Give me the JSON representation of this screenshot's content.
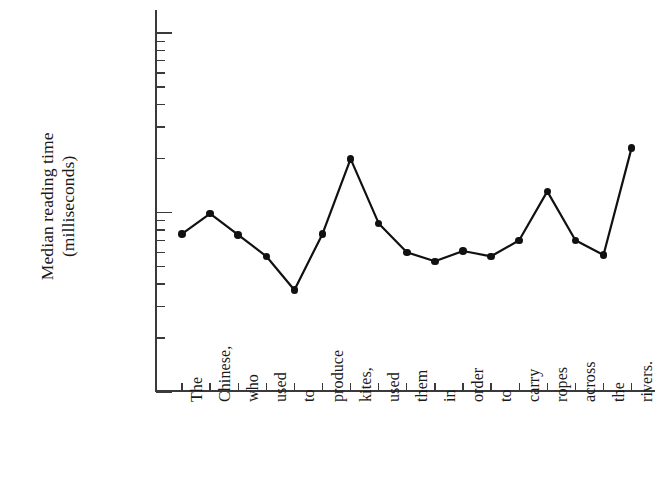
{
  "chart_data": {
    "type": "line",
    "title": "",
    "xlabel": "",
    "ylabel": "Median reading time (milliseconds)",
    "ylabel_line1": "Median reading time",
    "ylabel_line2": "(milliseconds)",
    "yscale": "log",
    "ylim": [
      100,
      10000
    ],
    "ytick_labels": [
      "10 000",
      "1000",
      "100"
    ],
    "ytick_values": [
      10000,
      1000,
      100
    ],
    "minor_ticks": true,
    "grid": false,
    "legend": "none",
    "categories": [
      "The",
      "Chinese,",
      "who",
      "used",
      "to",
      "produce",
      "kites,",
      "used",
      "them",
      "in",
      "order",
      "to",
      "carry",
      "ropes",
      "across",
      "the",
      "rivers."
    ],
    "values": [
      760,
      985,
      750,
      570,
      370,
      760,
      1990,
      870,
      600,
      535,
      610,
      570,
      700,
      1310,
      700,
      580,
      2290
    ],
    "series": [
      {
        "name": "Median reading time",
        "values": [
          760,
          985,
          750,
          570,
          370,
          760,
          1990,
          870,
          600,
          535,
          610,
          570,
          700,
          1310,
          700,
          580,
          2290
        ]
      }
    ],
    "marker": "filled-circle",
    "line_color": "#111111",
    "marker_color": "#111111"
  }
}
